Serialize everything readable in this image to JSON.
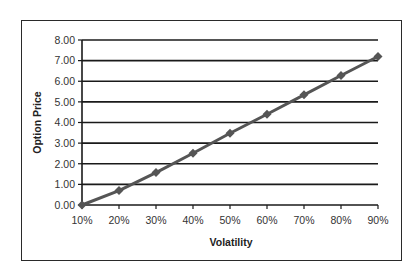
{
  "chart_data": {
    "type": "line",
    "title": "",
    "xlabel": "Volatility",
    "ylabel": "Option Price",
    "categories": [
      "10%",
      "20%",
      "30%",
      "40%",
      "50%",
      "60%",
      "70%",
      "80%",
      "90%"
    ],
    "x": [
      0.1,
      0.2,
      0.3,
      0.4,
      0.5,
      0.6,
      0.7,
      0.8,
      0.9
    ],
    "series": [
      {
        "name": "Option Price",
        "values": [
          0.0,
          0.7,
          1.57,
          2.51,
          3.48,
          4.4,
          5.34,
          6.28,
          7.2
        ],
        "marker": "diamond",
        "color": "#555555"
      }
    ],
    "ylim": [
      0,
      8
    ],
    "yticks": [
      "0.00",
      "1.00",
      "2.00",
      "3.00",
      "4.00",
      "5.00",
      "6.00",
      "7.00",
      "8.00"
    ],
    "grid": "horizontal",
    "legend": "none"
  },
  "colors": {
    "gridline": "#1a1a1a",
    "series_line": "#555555",
    "frame": "#2a2a2a"
  }
}
